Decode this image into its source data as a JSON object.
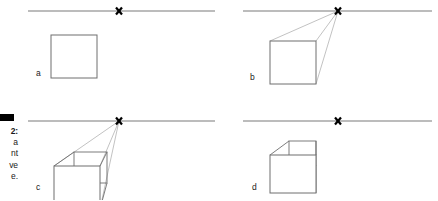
{
  "figure": {
    "marker": "black-bar",
    "caption_lines": [
      "2:",
      "a",
      "nt",
      "ve",
      "e."
    ],
    "caption_note": "caption is clipped at left page edge; only right-hand fragments of each line are visible"
  },
  "panels": [
    {
      "id": "a",
      "label": "a",
      "label_x": 36,
      "label_y": 76,
      "horizon": {
        "x1": 28,
        "y1": 11,
        "x2": 215,
        "y2": 11
      },
      "vanishing_point": {
        "x": 119,
        "y": 11,
        "marker": "x-mark"
      },
      "square": {
        "x": 51,
        "y": 35,
        "w": 46,
        "h": 43
      },
      "construction_lines": [],
      "back_face": null,
      "description": "Step a: horizon line with vanishing point and a plain front square"
    },
    {
      "id": "b",
      "label": "b",
      "label_x": 250,
      "label_y": 80,
      "horizon": {
        "x1": 243,
        "y1": 11,
        "x2": 432,
        "y2": 11
      },
      "vanishing_point": {
        "x": 338,
        "y": 11,
        "marker": "x-mark"
      },
      "square": {
        "x": 270,
        "y": 41,
        "w": 46,
        "h": 43
      },
      "construction_lines": [
        {
          "x1": 270,
          "y1": 41,
          "x2": 338,
          "y2": 11
        },
        {
          "x1": 316,
          "y1": 41,
          "x2": 338,
          "y2": 11
        },
        {
          "x1": 316,
          "y1": 84,
          "x2": 338,
          "y2": 11
        }
      ],
      "back_face": null,
      "description": "Step b: converging lines drawn from square corners to the vanishing point"
    },
    {
      "id": "c",
      "label": "c",
      "label_x": 36,
      "label_y": 190,
      "horizon": {
        "x1": 28,
        "y1": 121,
        "x2": 215,
        "y2": 121
      },
      "vanishing_point": {
        "x": 119,
        "y": 121,
        "marker": "x-mark"
      },
      "square": {
        "x": 54,
        "y": 166,
        "w": 46,
        "h": 43
      },
      "construction_lines": [
        {
          "x1": 54,
          "y1": 166,
          "x2": 119,
          "y2": 121
        },
        {
          "x1": 100,
          "y1": 166,
          "x2": 119,
          "y2": 121
        },
        {
          "x1": 100,
          "y1": 209,
          "x2": 119,
          "y2": 121
        }
      ],
      "back_face": {
        "x": 74,
        "y": 152,
        "w": 33,
        "h": 31
      },
      "description": "Step c: back edges added along the construction lines closing the box"
    },
    {
      "id": "d",
      "label": "d",
      "label_x": 252,
      "label_y": 190,
      "horizon": {
        "x1": 243,
        "y1": 121,
        "x2": 432,
        "y2": 121
      },
      "vanishing_point": {
        "x": 338,
        "y": 121,
        "marker": "x-mark"
      },
      "square": {
        "x": 270,
        "y": 155,
        "w": 46,
        "h": 38
      },
      "construction_lines": [],
      "back_face": {
        "x": 289,
        "y": 141,
        "w": 27,
        "h": 24
      },
      "description": "Step d: finished cube with construction lines erased"
    }
  ],
  "style": {
    "line_color": "#7a7a7a",
    "cube_line_color": "#6e6e6e",
    "construction_line_color": "#a8a8a8",
    "marker_color": "#000000",
    "label_color": "#1a1a1a",
    "background": "#ffffff"
  }
}
